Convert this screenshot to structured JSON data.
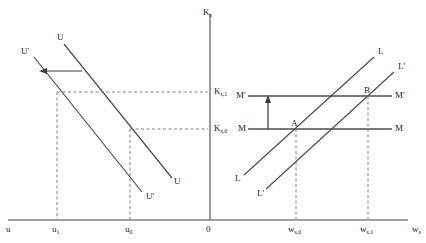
{
  "figure": {
    "type": "economics-diagram",
    "title": "",
    "axes": {
      "vertical_axis_label": "Kₛ",
      "vertical_axis_name": "Ks",
      "horizontal_axis_left_label": "u",
      "horizontal_axis_right_label": "wₛ",
      "origin_label": "0"
    },
    "left_panel": {
      "name": "unemployment-capital-panel",
      "x_ticks": [
        {
          "id": "u1",
          "label": "u",
          "sub": "1"
        },
        {
          "id": "u0",
          "label": "u",
          "sub": "0"
        }
      ],
      "y_ticks": [
        {
          "id": "Ks1",
          "label": "K",
          "sub": "s,1"
        },
        {
          "id": "Ks0",
          "label": "K",
          "sub": "s,0"
        }
      ],
      "curves": [
        {
          "id": "U",
          "label_top": "U",
          "label_bottom": "U",
          "note": "initial downward sloping curve"
        },
        {
          "id": "Uprime",
          "label_top": "U'",
          "label_bottom": "U'",
          "note": "shifted curve"
        }
      ],
      "shift_arrow": {
        "name": "leftward-shift-arrow",
        "direction": "left"
      }
    },
    "right_panel": {
      "name": "labor-market-panel",
      "x_ticks": [
        {
          "id": "ws0",
          "label": "w",
          "sub": "s,0"
        },
        {
          "id": "ws1",
          "label": "w",
          "sub": "s,1"
        }
      ],
      "curves": [
        {
          "id": "L",
          "label_left": "L",
          "label_right": "L",
          "note": "upward sloping labour supply"
        },
        {
          "id": "Lprime",
          "label_left": "L'",
          "label_right": "L'",
          "note": "shifted labour supply"
        },
        {
          "id": "M",
          "label_left": "M",
          "label_right": "M",
          "note": "horizontal line M"
        },
        {
          "id": "Mprime",
          "label_left": "M'",
          "label_right": "M'",
          "note": "horizontal line M prime"
        }
      ],
      "points": [
        {
          "id": "A",
          "label": "A"
        },
        {
          "id": "B",
          "label": "B"
        }
      ],
      "shift_arrow": {
        "name": "upward-shift-arrow",
        "direction": "up"
      }
    },
    "colors": {
      "axis": "#808080",
      "curve": "#4d4d4d",
      "dashed": "#808080",
      "text": "#1a1a1a"
    }
  }
}
